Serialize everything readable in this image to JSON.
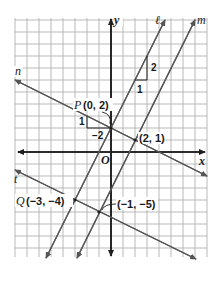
{
  "graph": {
    "axes": {
      "x_label": "x",
      "y_label": "y",
      "origin_label": "O"
    },
    "lines": {
      "l": {
        "label": "ℓ",
        "slope": 2,
        "through": [
          0,
          2
        ]
      },
      "m": {
        "label": "m",
        "slope": 2,
        "through": [
          2,
          1
        ]
      },
      "n": {
        "label": "n",
        "slope": -0.5,
        "through": [
          0,
          2
        ]
      },
      "t": {
        "label": "t",
        "slope": -0.5,
        "through": [
          -3,
          -4
        ]
      }
    },
    "points": {
      "P": {
        "name": "P",
        "coords": "(0, 2)"
      },
      "intersection_mn": {
        "coords": "(2, 1)"
      },
      "Q": {
        "name": "Q",
        "coords": "(−3, −4)"
      },
      "intersection_mt": {
        "coords": "(−1, −5)"
      }
    },
    "slope_triangles": {
      "l": {
        "run": "1",
        "rise": "2"
      },
      "n": {
        "rise": "1",
        "run": "−2"
      }
    },
    "colors": {
      "grid": "#a8a8a8",
      "axes": "#1e1e1e",
      "lines": "#555555"
    }
  }
}
